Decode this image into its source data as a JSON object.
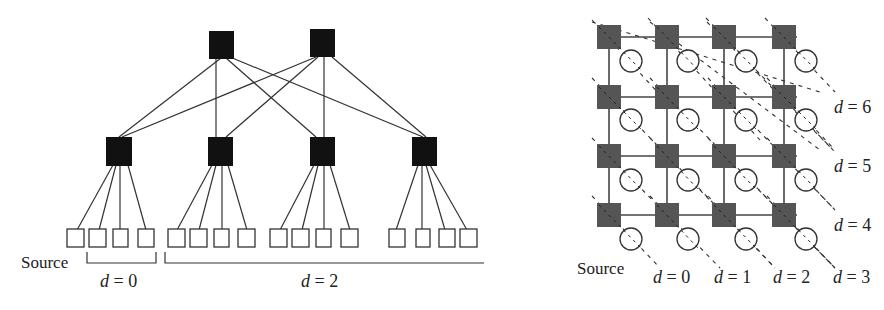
{
  "left_diagram": {
    "name": "fat-tree",
    "source_label": "Source",
    "bracket_labels": [
      {
        "var": "d",
        "eq": " = 0"
      },
      {
        "var": "d",
        "eq": " = 2"
      }
    ],
    "top_switch_count": 2,
    "mid_switch_count": 4,
    "leaf_count": 16,
    "colors": {
      "switch": "#111111",
      "leaf_fill": "#ffffff",
      "line": "#333333"
    }
  },
  "right_diagram": {
    "name": "mesh-4x4",
    "source_label": "Source",
    "bottom_labels": [
      {
        "var": "d",
        "eq": " = 0"
      },
      {
        "var": "d",
        "eq": " = 1"
      },
      {
        "var": "d",
        "eq": " = 2"
      },
      {
        "var": "d",
        "eq": " = 3"
      }
    ],
    "right_labels": [
      {
        "var": "d",
        "eq": " = 6"
      },
      {
        "var": "d",
        "eq": " = 5"
      },
      {
        "var": "d",
        "eq": " = 4"
      }
    ],
    "rows": 4,
    "cols": 4,
    "colors": {
      "router": "#555555",
      "node_fill": "#ffffff",
      "line": "#444444"
    }
  }
}
